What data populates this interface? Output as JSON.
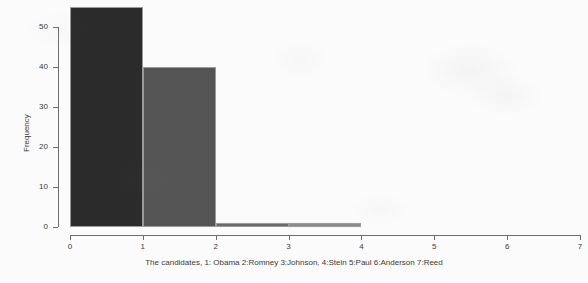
{
  "chart_data": {
    "type": "bar",
    "title": "",
    "subtitle": "",
    "xlabel": "The candidates, 1: Obama 2:Romney 3:Johnson, 4:Stein 5:Paul 6:Anderson 7:Reed",
    "ylabel": "Frequency",
    "xlim": [
      0,
      7
    ],
    "ylim": [
      0,
      55
    ],
    "grid": false,
    "legend": null,
    "x_tick_labels": [
      "0",
      "1",
      "2",
      "3",
      "4",
      "5",
      "6",
      "7"
    ],
    "x_tick_values": [
      0,
      1,
      2,
      3,
      4,
      5,
      6,
      7
    ],
    "y_tick_labels": [
      "0",
      "10",
      "20",
      "30",
      "40",
      "50"
    ],
    "y_tick_values": [
      0,
      10,
      20,
      30,
      40,
      50
    ],
    "bins": [
      {
        "label": "0-1",
        "x_start": 0,
        "x_end": 1,
        "value": 55,
        "color": "#2b2b2b"
      },
      {
        "label": "1-2",
        "x_start": 1,
        "x_end": 2,
        "value": 40,
        "color": "#555555"
      },
      {
        "label": "2-3",
        "x_start": 2,
        "x_end": 3,
        "value": 1,
        "color": "#6a6a6a"
      },
      {
        "label": "3-4",
        "x_start": 3,
        "x_end": 4,
        "value": 1,
        "color": "#8c8c8c"
      },
      {
        "label": "4-5",
        "x_start": 4,
        "x_end": 5,
        "value": 0,
        "color": "#b5b5b5"
      },
      {
        "label": "5-6",
        "x_start": 5,
        "x_end": 6,
        "value": 0,
        "color": "#c9c9c9"
      },
      {
        "label": "6-7",
        "x_start": 6,
        "x_end": 7,
        "value": 0,
        "color": "#dddddd"
      }
    ],
    "categories": [
      "0-1",
      "1-2",
      "2-3",
      "3-4",
      "4-5",
      "5-6",
      "6-7"
    ],
    "values": [
      55,
      40,
      1,
      1,
      0,
      0,
      0
    ],
    "axis_color": "#6e6e6e",
    "background_color": "#fbfbfb",
    "bar_border_color": "#9a9a9a"
  }
}
